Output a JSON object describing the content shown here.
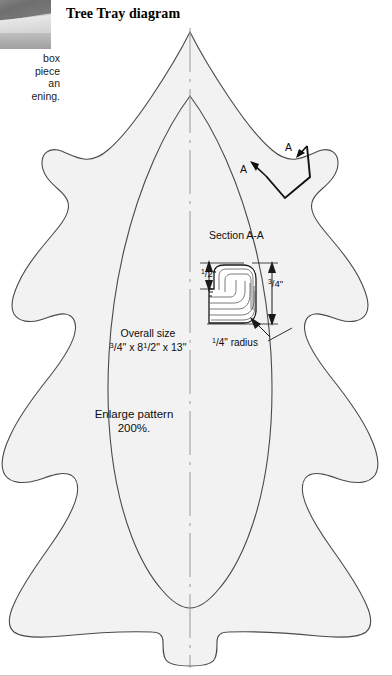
{
  "page": {
    "title": "Tree Tray diagram",
    "background": "#ffffff",
    "width": 392,
    "height": 676
  },
  "photo": {
    "name": "wood-tray-photo-fragment",
    "alt": "Partial photograph of finished wooden tray"
  },
  "caption": {
    "lines": [
      "box",
      "piece",
      "an",
      "ening."
    ],
    "note": "Caption text is cropped at the left page edge."
  },
  "pattern": {
    "overall_size_label": "Overall size",
    "overall_size_value_prefix": "3",
    "overall_size_value": "/4\" x 8",
    "overall_size_value_mid": "1",
    "overall_size_value_mid2": "/2\" x 13\"",
    "overall_size_text": "3/4\" x 8 1/2\" x 13\"",
    "enlarge_line1": "Enlarge pattern",
    "enlarge_line2": "200%.",
    "outline_fill": "#f2f2f2",
    "outline_stroke": "#4a4a4a",
    "centerline_color": "#9a9a9a"
  },
  "section": {
    "title": "Section A-A",
    "mark_left": "A",
    "mark_right": "A",
    "dim_height_text": "1/2\"",
    "dim_height_num": "1",
    "dim_height_den": "/2\"",
    "dim_thickness_text": "3/4\"",
    "dim_thickness_num": "3",
    "dim_thickness_den": "/4\"",
    "radius_num": "1",
    "radius_den": "/4\" radius",
    "radius_text": "1/4\" radius",
    "profile_fill": "#ffffff",
    "profile_stroke": "#1a1a1a",
    "grain_stroke": "#4d4d4d"
  },
  "icons": {
    "arrow_up": "arrow-up-icon",
    "arrow_down": "arrow-down-icon",
    "leader_line": "leader-line-icon"
  }
}
